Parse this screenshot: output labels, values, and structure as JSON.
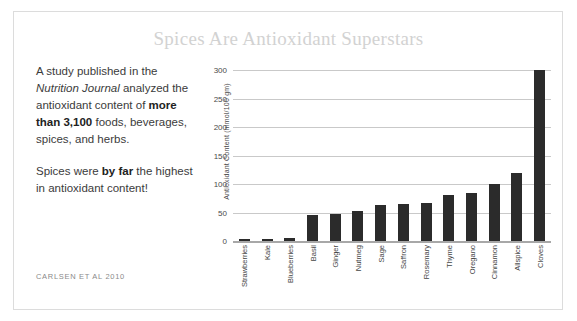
{
  "title": "Spices Are Antioxidant Superstars",
  "narrative": {
    "p1_a": "A study published in the ",
    "p1_journal": "Nutrition Journal",
    "p1_b": " analyzed the antioxidant content of ",
    "p1_bold": "more than 3,100",
    "p1_c": " foods, beverages, spices, and herbs.",
    "p2_a": "Spices were ",
    "p2_bold": "by far",
    "p2_b": " the highest in antioxidant content!"
  },
  "citation": "CARLSEN ET AL 2010",
  "colors": {
    "bar": "#2b2b2b",
    "title": "#d2d2d2",
    "gridline": "#c9c9c9",
    "border": "#dcdcdc",
    "text": "#3b3b3b"
  },
  "chart_data": {
    "type": "bar",
    "title": "Spices Are Antioxidant Superstars",
    "xlabel": "",
    "ylabel": "Antioxidant Content (mmol/100 gm)",
    "ylim": [
      0,
      300
    ],
    "yticks": [
      0,
      50,
      100,
      150,
      200,
      250,
      300
    ],
    "grid": true,
    "legend": "none",
    "categories": [
      "Strawberries",
      "Kale",
      "Blueberries",
      "Basil",
      "Ginger",
      "Nutmeg",
      "Sage",
      "Saffron",
      "Rosemary",
      "Thyme",
      "Oregano",
      "Cinnamon",
      "Allspice",
      "Cloves"
    ],
    "values": [
      4,
      3,
      6,
      45,
      47,
      52,
      63,
      65,
      66,
      80,
      85,
      100,
      120,
      300
    ]
  }
}
